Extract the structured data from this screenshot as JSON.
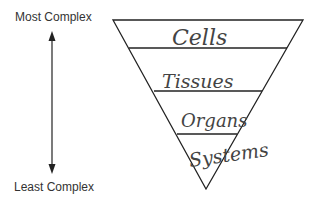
{
  "diagram": {
    "axis": {
      "top_label": "Most Complex",
      "bottom_label": "Least Complex",
      "direction": "bidirectional-vertical-arrow"
    },
    "pyramid": {
      "shape": "inverted-triangle",
      "levels": [
        {
          "label": "Cells",
          "order": 1
        },
        {
          "label": "Tissues",
          "order": 2
        },
        {
          "label": "Organs",
          "order": 3
        },
        {
          "label": "Systems",
          "order": 4
        }
      ]
    },
    "colors": {
      "line": "#222222",
      "text": "#333333",
      "handwriting": "#444444",
      "background": "#ffffff"
    }
  }
}
